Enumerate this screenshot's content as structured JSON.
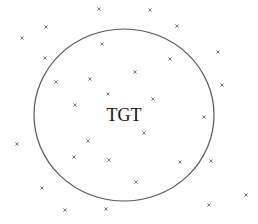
{
  "diagram": {
    "target_label": "TGT",
    "mark_glyph": "×",
    "circle_color": "#555555",
    "mark_color": "#555555",
    "label_color": "#111111",
    "marks_inside_count": 12,
    "marks_outside_count": 16
  }
}
